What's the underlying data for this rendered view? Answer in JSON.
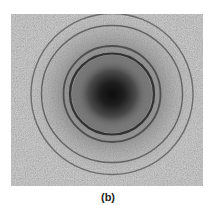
{
  "figure": {
    "caption": "(b)",
    "panel": {
      "x": 11,
      "y": 14,
      "width": 192,
      "height": 172
    },
    "center": {
      "x": 101,
      "y": 80
    },
    "rings": [
      {
        "name": "ring-1",
        "rx": 42,
        "ry": 40.5,
        "stroke": 2.2,
        "opacity": 0.85
      },
      {
        "name": "ring-2",
        "rx": 48.5,
        "ry": 48,
        "stroke": 1.8,
        "opacity": 0.6
      },
      {
        "name": "ring-3",
        "rx": 70.5,
        "ry": 68.5,
        "stroke": 1.4,
        "opacity": 0.55
      },
      {
        "name": "ring-4",
        "rx": 81,
        "ry": 80.5,
        "stroke": 1.4,
        "opacity": 0.5
      }
    ],
    "colors": {
      "background": "#b9b9b9",
      "center_spot": "#111111",
      "ring": "#222222"
    }
  }
}
